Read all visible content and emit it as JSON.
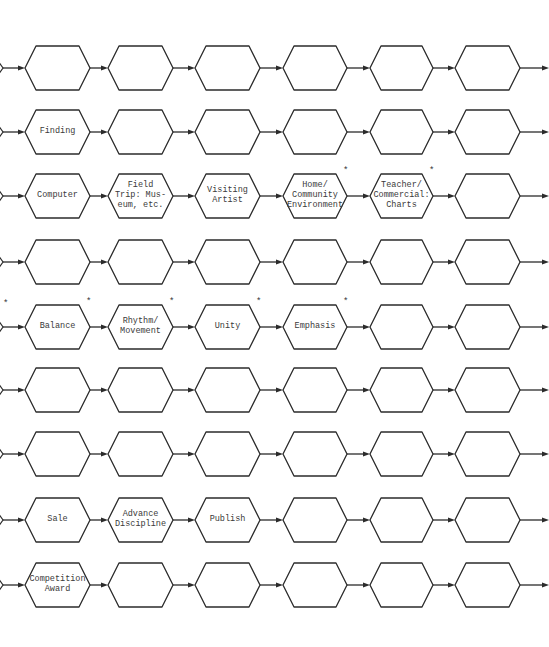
{
  "diagram": {
    "type": "flow-grid",
    "stroke_color": "#2b2b2b",
    "background": "#ffffff",
    "row_centers_y": [
      68,
      132,
      196,
      262,
      327,
      390,
      454,
      520,
      585
    ],
    "column_x": [
      [
        25,
        90
      ],
      [
        108,
        173
      ],
      [
        195,
        260
      ],
      [
        283,
        347
      ],
      [
        370,
        433
      ],
      [
        455,
        520
      ]
    ],
    "rows": [
      {
        "cells": [
          {
            "label": "",
            "asterisk": false
          },
          {
            "label": "",
            "asterisk": false
          },
          {
            "label": "",
            "asterisk": false
          },
          {
            "label": "",
            "asterisk": false
          },
          {
            "label": "",
            "asterisk": false
          },
          {
            "label": "",
            "asterisk": false
          }
        ]
      },
      {
        "cells": [
          {
            "label": "Finding",
            "asterisk": false
          },
          {
            "label": "",
            "asterisk": false
          },
          {
            "label": "",
            "asterisk": false
          },
          {
            "label": "",
            "asterisk": false
          },
          {
            "label": "",
            "asterisk": false
          },
          {
            "label": "",
            "asterisk": false
          }
        ]
      },
      {
        "cells": [
          {
            "label": "Computer",
            "asterisk": false
          },
          {
            "label": "Field\nTrip: Mus-\neum, etc.",
            "asterisk": false
          },
          {
            "label": "Visiting\nArtist",
            "asterisk": false
          },
          {
            "label": "Home/\nCommunity\nEnvironment",
            "asterisk": true
          },
          {
            "label": "Teacher/\nCommercial:\nCharts",
            "asterisk": true
          },
          {
            "label": "",
            "asterisk": false
          }
        ]
      },
      {
        "cells": [
          {
            "label": "",
            "asterisk": false
          },
          {
            "label": "",
            "asterisk": false
          },
          {
            "label": "",
            "asterisk": false
          },
          {
            "label": "",
            "asterisk": false
          },
          {
            "label": "",
            "asterisk": false
          },
          {
            "label": "",
            "asterisk": false
          }
        ]
      },
      {
        "leading_asterisk": true,
        "cells": [
          {
            "label": "Balance",
            "asterisk": true
          },
          {
            "label": "Rhythm/\nMovement",
            "asterisk": true
          },
          {
            "label": "Unity",
            "asterisk": true
          },
          {
            "label": "Emphasis",
            "asterisk": true
          },
          {
            "label": "",
            "asterisk": false
          },
          {
            "label": "",
            "asterisk": false
          }
        ]
      },
      {
        "cells": [
          {
            "label": "",
            "asterisk": false
          },
          {
            "label": "",
            "asterisk": false
          },
          {
            "label": "",
            "asterisk": false
          },
          {
            "label": "",
            "asterisk": false
          },
          {
            "label": "",
            "asterisk": false
          },
          {
            "label": "",
            "asterisk": false
          }
        ]
      },
      {
        "cells": [
          {
            "label": "",
            "asterisk": false
          },
          {
            "label": "",
            "asterisk": false
          },
          {
            "label": "",
            "asterisk": false
          },
          {
            "label": "",
            "asterisk": false
          },
          {
            "label": "",
            "asterisk": false
          },
          {
            "label": "",
            "asterisk": false
          }
        ]
      },
      {
        "cells": [
          {
            "label": "Sale",
            "asterisk": false
          },
          {
            "label": "Advance\nDiscipline",
            "asterisk": false
          },
          {
            "label": "Publish",
            "asterisk": false
          },
          {
            "label": "",
            "asterisk": false
          },
          {
            "label": "",
            "asterisk": false
          },
          {
            "label": "",
            "asterisk": false
          }
        ]
      },
      {
        "cells": [
          {
            "label": "Competition\nAward",
            "asterisk": false
          },
          {
            "label": "",
            "asterisk": false
          },
          {
            "label": "",
            "asterisk": false
          },
          {
            "label": "",
            "asterisk": false
          },
          {
            "label": "",
            "asterisk": false
          },
          {
            "label": "",
            "asterisk": false
          }
        ]
      }
    ],
    "asterisk_symbol": "*"
  }
}
